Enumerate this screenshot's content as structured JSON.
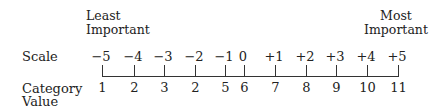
{
  "left_label": {
    "line1": "Least",
    "line2": "Important"
  },
  "right_label": {
    "line1": "Most",
    "line2": "Important"
  },
  "rows": {
    "scale": "Scale",
    "category_line1": "Category",
    "category_line2": "Value"
  },
  "ticks": [
    {
      "scale": "−5",
      "value": "1"
    },
    {
      "scale": "−4",
      "value": "2"
    },
    {
      "scale": "−3",
      "value": "3"
    },
    {
      "scale": "−2",
      "value": "2"
    },
    {
      "scale": "−1",
      "value": "5"
    },
    {
      "scale": "0",
      "value": "6"
    },
    {
      "scale": "+1",
      "value": "7"
    },
    {
      "scale": "+2",
      "value": "8"
    },
    {
      "scale": "+3",
      "value": "9"
    },
    {
      "scale": "+4",
      "value": "10"
    },
    {
      "scale": "+5",
      "value": "11"
    }
  ]
}
